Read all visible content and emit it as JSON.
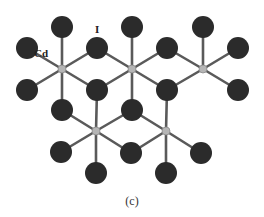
{
  "figure": {
    "caption": "(c)",
    "labels": {
      "cd": "Cd",
      "i": "I"
    },
    "colors": {
      "iodine_atom": "#2b2b2b",
      "cadmium_atom": "#b5b5b5",
      "bond": "#5a5a5a",
      "background": "#ffffff"
    },
    "cadmium_atoms": [
      {
        "x": 62,
        "y": 69
      },
      {
        "x": 132,
        "y": 69
      },
      {
        "x": 203,
        "y": 69
      },
      {
        "x": 96,
        "y": 131
      },
      {
        "x": 166,
        "y": 131
      }
    ],
    "iodine_atoms": [
      {
        "x": 62,
        "y": 27
      },
      {
        "x": 132,
        "y": 27
      },
      {
        "x": 203,
        "y": 27
      },
      {
        "x": 27,
        "y": 48
      },
      {
        "x": 97,
        "y": 48
      },
      {
        "x": 167,
        "y": 48
      },
      {
        "x": 238,
        "y": 48
      },
      {
        "x": 27,
        "y": 90
      },
      {
        "x": 97,
        "y": 90
      },
      {
        "x": 167,
        "y": 90
      },
      {
        "x": 238,
        "y": 90
      },
      {
        "x": 62,
        "y": 110
      },
      {
        "x": 132,
        "y": 110
      },
      {
        "x": 61,
        "y": 152
      },
      {
        "x": 131,
        "y": 153
      },
      {
        "x": 201,
        "y": 153
      },
      {
        "x": 96,
        "y": 173
      },
      {
        "x": 166,
        "y": 173
      }
    ]
  }
}
